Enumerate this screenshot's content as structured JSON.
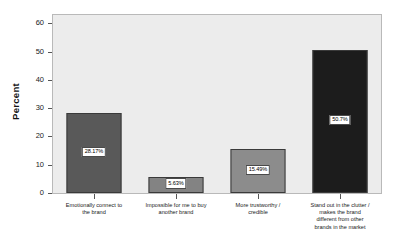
{
  "chart_data": {
    "type": "bar",
    "title": "",
    "xlabel": "",
    "ylabel": "Percent",
    "ylim": [
      0,
      63
    ],
    "yticks": [
      0,
      10,
      20,
      30,
      40,
      50,
      60
    ],
    "grid": false,
    "legend": "none",
    "categories": [
      "Emotionally connect to\nthe brand",
      "Impossible for me to buy\nanother brand",
      "More trustworthy /\ncredible",
      "Stand out in the clutter /\nmakes the brand\ndifferent from other\nbrands in the market"
    ],
    "values": [
      28.17,
      5.63,
      15.49,
      50.7
    ],
    "data_labels": [
      "28.17%",
      "5.63%",
      "15.49%",
      "50.7%"
    ],
    "bar_colors": [
      "#595959",
      "#838383",
      "#8c8c8c",
      "#1c1c1c"
    ],
    "plot_background": "#ececec",
    "frame_color": "#b9b9b9"
  },
  "axis": {
    "y_title": "Percent",
    "y_tick_labels": [
      "0",
      "10",
      "20",
      "30",
      "40",
      "50",
      "60"
    ]
  }
}
